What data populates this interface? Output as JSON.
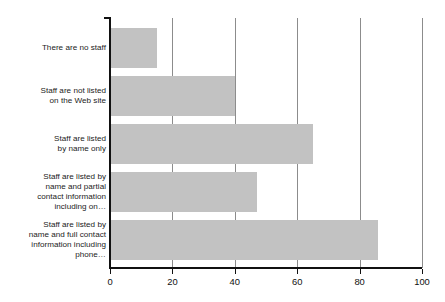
{
  "chart_data": {
    "type": "bar",
    "orientation": "horizontal",
    "title": "",
    "subtitle": "",
    "xlabel": "",
    "ylabel": "",
    "xlim": [
      0,
      100
    ],
    "grid": true,
    "legend": null,
    "legend_position": "none",
    "bar_color": "#c2c2c2",
    "axis_color": "#111111",
    "gridline_color": "#8c8c8c",
    "background_color": "#ffffff",
    "categories": [
      "There are no staff",
      "Staff are not listed\non the Web site",
      "Staff are listed\nby name only",
      "Staff are listed by\nname and partial\ncontact information\nincluding on…",
      "Staff are listed by\nname and full contact\ninformation including\nphone…"
    ],
    "values": [
      15,
      40,
      65,
      47,
      86
    ],
    "xticks": [
      0,
      20,
      40,
      60,
      80,
      100
    ],
    "xticklabels": [
      "0",
      "20",
      "40",
      "60",
      "80",
      "100"
    ]
  }
}
